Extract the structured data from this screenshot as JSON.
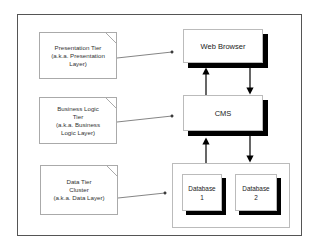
{
  "diagram": {
    "notes": [
      {
        "label_lines": [
          "Presentation Tier",
          "(a.k.a. Presentation",
          "Layer)"
        ]
      },
      {
        "label_lines": [
          "Business Logic",
          "Tier",
          "(a.k.a. Business",
          "Logic Layer)"
        ]
      },
      {
        "label_lines": [
          "Data Tier",
          "Cluster",
          "(a.k.a. Data Layer)"
        ]
      }
    ],
    "components": {
      "web_browser": "Web Browser",
      "cms": "CMS",
      "database1_lines": [
        "Database",
        "1"
      ],
      "database2_lines": [
        "Database",
        "2"
      ]
    },
    "edges": [
      {
        "from": "CMS",
        "to": "Web Browser"
      },
      {
        "from": "Web Browser",
        "to": "CMS"
      },
      {
        "from": "Data Tier Cluster",
        "to": "CMS"
      },
      {
        "from": "CMS",
        "to": "Data Tier Cluster"
      }
    ],
    "colors": {
      "shadow": "#000000",
      "border": "#555555",
      "note_border": "#aaaaaa"
    }
  }
}
